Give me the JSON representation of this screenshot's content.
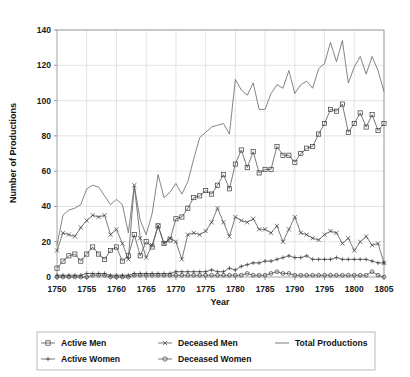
{
  "chart_data": {
    "type": "line",
    "title": "",
    "xlabel": "Year",
    "ylabel": "Number of Productions",
    "xlim": [
      1750,
      1805
    ],
    "ylim": [
      0,
      140
    ],
    "xticks": [
      1750,
      1755,
      1760,
      1765,
      1770,
      1775,
      1780,
      1785,
      1790,
      1795,
      1800,
      1805
    ],
    "yticks": [
      0,
      20,
      40,
      60,
      80,
      100,
      120,
      140
    ],
    "grid": true,
    "legend_position": "below",
    "x": [
      1750,
      1751,
      1752,
      1753,
      1754,
      1755,
      1756,
      1757,
      1758,
      1759,
      1760,
      1761,
      1762,
      1763,
      1764,
      1765,
      1766,
      1767,
      1768,
      1769,
      1770,
      1771,
      1772,
      1773,
      1774,
      1775,
      1776,
      1777,
      1778,
      1779,
      1780,
      1781,
      1782,
      1783,
      1784,
      1785,
      1786,
      1787,
      1788,
      1789,
      1790,
      1791,
      1792,
      1793,
      1794,
      1795,
      1796,
      1797,
      1798,
      1799,
      1800,
      1801,
      1802,
      1803,
      1804,
      1805
    ],
    "series": [
      {
        "name": "Active Men",
        "marker": "square",
        "values": [
          5,
          9,
          12,
          13,
          9,
          13,
          17,
          13,
          10,
          15,
          17,
          9,
          12,
          24,
          12,
          20,
          17,
          29,
          19,
          21,
          33,
          34,
          39,
          45,
          46,
          49,
          47,
          52,
          58,
          50,
          64,
          72,
          62,
          71,
          59,
          61,
          61,
          74,
          69,
          69,
          65,
          70,
          73,
          74,
          81,
          87,
          95,
          94,
          98,
          82,
          87,
          93,
          85,
          92,
          83,
          87
        ]
      },
      {
        "name": "Deceased Men",
        "marker": "x",
        "values": [
          15,
          25,
          24,
          23,
          28,
          32,
          35,
          34,
          35,
          24,
          27,
          19,
          10,
          52,
          22,
          11,
          18,
          29,
          19,
          22,
          20,
          10,
          24,
          25,
          24,
          26,
          31,
          39,
          31,
          23,
          34,
          32,
          31,
          33,
          27,
          27,
          25,
          29,
          20,
          27,
          34,
          25,
          24,
          22,
          21,
          24,
          26,
          25,
          19,
          22,
          15,
          20,
          23,
          18,
          19,
          8
        ]
      },
      {
        "name": "Active Women",
        "marker": "plus",
        "values": [
          1,
          1,
          1,
          1,
          1,
          2,
          2,
          2,
          2,
          1,
          1,
          1,
          1,
          2,
          2,
          2,
          2,
          2,
          2,
          2,
          3,
          3,
          3,
          3,
          3,
          3,
          4,
          3,
          3,
          5,
          4,
          6,
          7,
          8,
          8,
          9,
          9,
          10,
          11,
          12,
          11,
          11,
          12,
          10,
          10,
          10,
          10,
          11,
          10,
          10,
          10,
          10,
          10,
          9,
          8,
          8
        ]
      },
      {
        "name": "Deceased Women",
        "marker": "circle",
        "values": [
          0,
          0,
          0,
          0,
          0,
          0,
          1,
          1,
          1,
          0,
          0,
          0,
          0,
          1,
          1,
          1,
          1,
          1,
          1,
          1,
          1,
          1,
          1,
          1,
          1,
          1,
          1,
          1,
          1,
          1,
          1,
          1,
          2,
          1,
          1,
          1,
          2,
          3,
          2,
          2,
          1,
          1,
          1,
          1,
          1,
          1,
          1,
          1,
          1,
          1,
          1,
          1,
          1,
          3,
          1,
          0
        ]
      },
      {
        "name": "Total Productions",
        "marker": "none",
        "values": [
          18,
          35,
          38,
          39,
          41,
          50,
          52,
          51,
          46,
          41,
          44,
          41,
          25,
          52,
          32,
          24,
          36,
          58,
          45,
          48,
          53,
          47,
          54,
          67,
          79,
          82,
          85,
          86,
          87,
          81,
          112,
          106,
          103,
          110,
          95,
          95,
          104,
          109,
          107,
          117,
          104,
          109,
          111,
          107,
          118,
          121,
          133,
          122,
          134,
          110,
          119,
          125,
          115,
          125,
          117,
          105
        ]
      }
    ]
  },
  "axes": {
    "y_label": "Number of Productions",
    "x_label": "Year",
    "y_tick_labels": [
      "0",
      "20",
      "40",
      "60",
      "80",
      "100",
      "120",
      "140"
    ],
    "x_tick_labels": [
      "1750",
      "1755",
      "1760",
      "1765",
      "1770",
      "1775",
      "1780",
      "1785",
      "1790",
      "1795",
      "1800",
      "1805"
    ]
  },
  "legend": {
    "items": [
      {
        "label": "Active Men",
        "marker": "square-marker"
      },
      {
        "label": "Deceased Men",
        "marker": "x-marker"
      },
      {
        "label": "Total Productions",
        "marker": "line-marker"
      },
      {
        "label": "Active Women",
        "marker": "plus-marker"
      },
      {
        "label": "Deceased Women",
        "marker": "circle-marker"
      }
    ]
  },
  "colors": {
    "line": "#4d4d4d",
    "total_line": "#666666",
    "grid": "#d2d2d2",
    "frame": "#9a9a9a",
    "text": "#111111",
    "background": "#ffffff"
  }
}
